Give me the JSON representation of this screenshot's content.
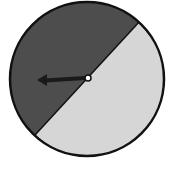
{
  "diagram": {
    "type": "spinner",
    "sections": [
      {
        "name": "dark-section",
        "color": "#4d4d4d",
        "fraction": 0.5
      },
      {
        "name": "light-section",
        "color": "#d6d6d6",
        "fraction": 0.5
      }
    ],
    "outline_color": "#111111",
    "arrow": {
      "color": "#1a1a1a",
      "direction": "left"
    },
    "pivot_color": "#ffffff"
  }
}
